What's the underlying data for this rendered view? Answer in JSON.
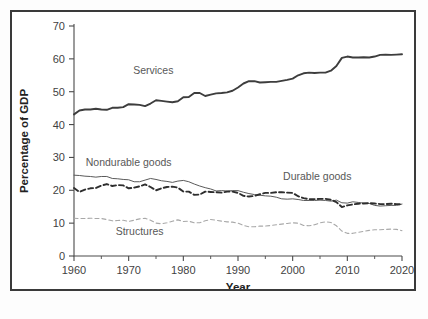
{
  "chart_data": {
    "type": "line",
    "title": "",
    "xlabel": "Year",
    "ylabel": "Percentage of GDP",
    "xlim": [
      1960,
      2020
    ],
    "ylim": [
      0,
      70
    ],
    "xticks": [
      1960,
      1970,
      1980,
      1990,
      2000,
      2010,
      2020
    ],
    "xtick_labels": [
      "1960",
      "1970",
      "1980",
      "1990",
      "2000",
      "2010",
      "2020"
    ],
    "xticks_minor": [
      1965,
      1975,
      1985,
      1995,
      2005,
      2015
    ],
    "yticks": [
      0,
      10,
      20,
      30,
      40,
      50,
      60,
      70
    ],
    "ytick_labels": [
      "0",
      "10",
      "20",
      "30",
      "40",
      "50",
      "60",
      "70"
    ],
    "grid": false,
    "legend_position": "inline-annotations",
    "annotations": [
      {
        "text": "Services",
        "x": 1974.5,
        "y": 55.5
      },
      {
        "text": "Nondurable goods",
        "x": 1970.0,
        "y": 27.5
      },
      {
        "text": "Durable goods",
        "x": 2004.5,
        "y": 23.0
      },
      {
        "text": "Structures",
        "x": 1972.0,
        "y": 6.5
      }
    ],
    "x": [
      1960,
      1961,
      1962,
      1963,
      1964,
      1965,
      1966,
      1967,
      1968,
      1969,
      1970,
      1971,
      1972,
      1973,
      1974,
      1975,
      1976,
      1977,
      1978,
      1979,
      1980,
      1981,
      1982,
      1983,
      1984,
      1985,
      1986,
      1987,
      1988,
      1989,
      1990,
      1991,
      1992,
      1993,
      1994,
      1995,
      1996,
      1997,
      1998,
      1999,
      2000,
      2001,
      2002,
      2003,
      2004,
      2005,
      2006,
      2007,
      2008,
      2009,
      2010,
      2011,
      2012,
      2013,
      2014,
      2015,
      2016,
      2017,
      2018,
      2019,
      2020
    ],
    "series": [
      {
        "name": "Services",
        "style": "solid",
        "color": "#3d3d3d",
        "width": 1.9,
        "values": [
          43.1,
          44.3,
          44.6,
          44.6,
          44.8,
          44.6,
          44.5,
          45.1,
          45.1,
          45.3,
          46.2,
          46.1,
          46.0,
          45.6,
          46.4,
          47.4,
          47.2,
          47.0,
          46.8,
          47.1,
          48.3,
          48.4,
          49.6,
          49.6,
          48.7,
          49.1,
          49.5,
          49.6,
          49.8,
          50.3,
          51.3,
          52.5,
          53.2,
          53.2,
          52.8,
          52.9,
          53.0,
          53.0,
          53.3,
          53.6,
          54.0,
          55.0,
          55.6,
          55.8,
          55.7,
          55.8,
          55.8,
          56.4,
          57.8,
          60.3,
          60.7,
          60.4,
          60.4,
          60.5,
          60.4,
          60.7,
          61.2,
          61.3,
          61.2,
          61.3,
          61.4
        ]
      },
      {
        "name": "Nondurable goods",
        "style": "solid",
        "color": "#5a5a5a",
        "width": 1.0,
        "values": [
          24.6,
          24.5,
          24.3,
          24.2,
          24.0,
          24.2,
          24.2,
          23.6,
          23.5,
          23.3,
          23.2,
          22.6,
          22.6,
          23.1,
          23.6,
          23.3,
          22.9,
          22.7,
          22.4,
          22.8,
          23.0,
          22.6,
          21.9,
          21.3,
          20.8,
          20.4,
          19.8,
          19.9,
          19.8,
          19.9,
          19.9,
          19.4,
          19.0,
          18.7,
          18.5,
          18.3,
          18.2,
          17.9,
          17.4,
          17.3,
          17.4,
          17.2,
          16.9,
          16.9,
          16.9,
          17.0,
          16.9,
          16.7,
          17.0,
          16.2,
          16.1,
          16.5,
          16.3,
          16.1,
          16.0,
          15.4,
          15.2,
          15.3,
          15.4,
          15.4,
          15.8
        ]
      },
      {
        "name": "Durable goods",
        "style": "dashed",
        "color": "#2e2e2e",
        "width": 1.9,
        "values": [
          20.7,
          19.5,
          20.2,
          20.6,
          20.7,
          21.4,
          21.9,
          21.3,
          21.6,
          21.5,
          20.6,
          20.8,
          21.2,
          21.8,
          21.0,
          20.0,
          20.6,
          21.0,
          21.1,
          20.8,
          19.6,
          19.6,
          18.6,
          18.7,
          19.6,
          19.5,
          19.4,
          19.3,
          19.6,
          19.6,
          19.2,
          18.3,
          18.1,
          18.3,
          18.8,
          19.2,
          19.2,
          19.4,
          19.4,
          19.3,
          19.2,
          18.2,
          17.6,
          17.3,
          17.3,
          17.4,
          17.4,
          17.1,
          16.4,
          14.9,
          15.4,
          15.7,
          15.9,
          16.0,
          16.1,
          16.0,
          15.8,
          15.8,
          15.9,
          15.8,
          15.7
        ]
      },
      {
        "name": "Structures",
        "style": "dashed",
        "color": "#a8a8a8",
        "width": 1.1,
        "values": [
          11.5,
          11.4,
          11.4,
          11.5,
          11.4,
          11.4,
          11.1,
          10.7,
          10.8,
          10.9,
          10.5,
          10.9,
          11.3,
          11.5,
          10.9,
          10.0,
          9.8,
          10.1,
          10.6,
          11.0,
          10.5,
          10.6,
          10.1,
          10.1,
          10.7,
          11.1,
          10.9,
          10.6,
          10.4,
          10.3,
          10.0,
          9.3,
          8.9,
          8.9,
          9.1,
          9.1,
          9.3,
          9.5,
          9.7,
          9.9,
          10.1,
          10.0,
          9.3,
          9.2,
          9.5,
          10.1,
          10.4,
          10.2,
          9.2,
          7.6,
          6.9,
          6.9,
          7.2,
          7.5,
          7.8,
          8.0,
          8.0,
          8.1,
          8.2,
          8.1,
          7.7
        ]
      }
    ]
  }
}
